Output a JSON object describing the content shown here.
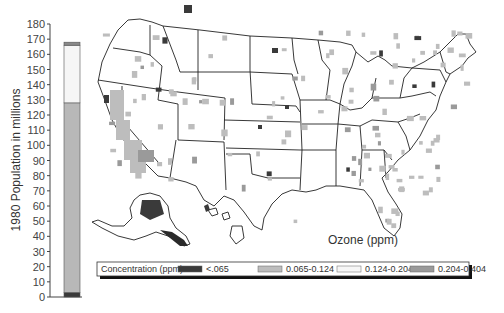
{
  "chart_data": [
    {
      "type": "bar",
      "stacked": true,
      "title": "",
      "xlabel": "",
      "ylabel": "1980 Population in millions",
      "ylim": [
        0,
        180
      ],
      "yticks": [
        0,
        10,
        20,
        30,
        40,
        50,
        60,
        70,
        80,
        90,
        100,
        110,
        120,
        130,
        140,
        150,
        160,
        170,
        180
      ],
      "categories": [
        "1980"
      ],
      "series": [
        {
          "name": "<.065",
          "values": [
            3
          ],
          "color": "#3a3a3a"
        },
        {
          "name": "0.065-0.124",
          "values": [
            125
          ],
          "color": "#b8b8b8"
        },
        {
          "name": "0.124-0.204",
          "values": [
            38
          ],
          "color": "#f6f6f6"
        },
        {
          "name": "0.204-0.404",
          "values": [
            2
          ],
          "color": "#8a8a8a"
        }
      ],
      "total": 168,
      "grid": false
    },
    {
      "type": "heatmap",
      "subtype": "choropleth-map",
      "region": "United States (contiguous, Alaska, Hawaii)",
      "label": "Ozone (ppm)",
      "legend": {
        "title": "Concentration (ppm)",
        "placement": "bottom",
        "entries": [
          {
            "label": "<.065",
            "color": "#3a3a3a"
          },
          {
            "label": "0.065-0.124",
            "color": "#bdbdbd"
          },
          {
            "label": "0.124-0.204",
            "color": "#f6f6f6"
          },
          {
            "label": "0.204-0.404",
            "color": "#9a9a9a"
          }
        ]
      }
    }
  ]
}
